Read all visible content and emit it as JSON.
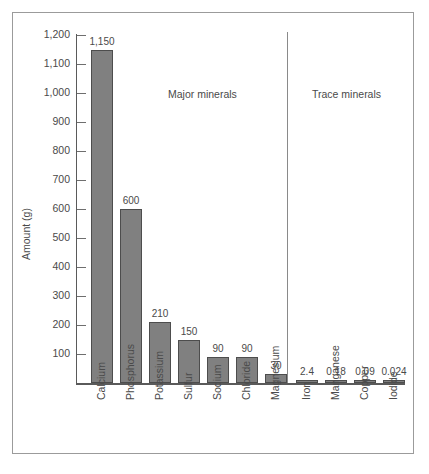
{
  "chart_data": {
    "type": "bar",
    "title": "",
    "xlabel": "",
    "ylabel": "Amount (g)",
    "ylim": [
      0,
      1200
    ],
    "grid": false,
    "legend_position": "none",
    "ytick_labels": [
      "1,200",
      "1,100",
      "1,000",
      "900",
      "800",
      "700",
      "600",
      "500",
      "400",
      "300",
      "200",
      "100"
    ],
    "ytick_values": [
      1200,
      1100,
      1000,
      900,
      800,
      700,
      600,
      500,
      400,
      300,
      200,
      100
    ],
    "categories": [
      "Calcium",
      "Phosphorus",
      "Potassium",
      "Sulfur",
      "Sodium",
      "Chloride",
      "Magnesium",
      "Iron",
      "Manganese",
      "Copper",
      "Iodide"
    ],
    "values": [
      1150,
      600,
      210,
      150,
      90,
      90,
      30,
      2.4,
      0.18,
      0.09,
      0.024
    ],
    "value_labels": [
      "1,150",
      "600",
      "210",
      "150",
      "90",
      "90",
      "30",
      "2.4",
      "0.18",
      "0.09",
      "0.024"
    ],
    "annotations": [
      {
        "text": "Major minerals",
        "group": "major"
      },
      {
        "text": "Trace minerals",
        "group": "trace"
      }
    ],
    "groups": [
      {
        "name": "Major minerals",
        "categories": [
          "Calcium",
          "Phosphorus",
          "Potassium",
          "Sulfur",
          "Sodium",
          "Chloride",
          "Magnesium"
        ]
      },
      {
        "name": "Trace minerals",
        "categories": [
          "Iron",
          "Manganese",
          "Copper",
          "Iodide"
        ]
      }
    ],
    "colors": {
      "bar_fill": "#808080",
      "bar_stroke": "#4d4d4d",
      "axis": "#5a5a5a",
      "text": "#4a4a4a",
      "frame": "#9b9b9b"
    }
  }
}
